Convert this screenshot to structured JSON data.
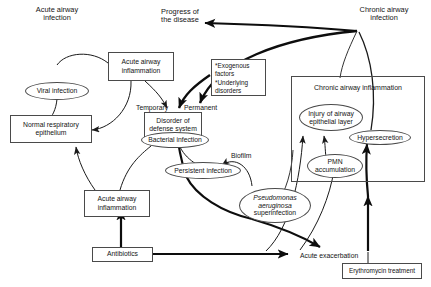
{
  "figure": {
    "type": "flow-diagram",
    "region_captions": [
      {
        "id": "acute-region",
        "text": "Acute airway\ninfection"
      },
      {
        "id": "chronic-region",
        "text": "Chronic airway\ninfection"
      },
      {
        "id": "progress-outcome",
        "text": "Progress of\nthe disease"
      }
    ],
    "nodes": {
      "normal_respiratory_epithelium": {
        "shape": "rect",
        "text": "Normal respiratory\nepithelium"
      },
      "viral_infection": {
        "shape": "ellipse",
        "text": "Viral infection"
      },
      "acute_airway_inflammation_top": {
        "shape": "rect",
        "text": "Acute airway\ninflammation"
      },
      "acute_airway_inflammation_bottom": {
        "shape": "rect",
        "text": "Acute airway\ninflammation"
      },
      "disorder_of_defense_system": {
        "shape": "rect",
        "text": "Disorder of\ndefense system"
      },
      "bacterial_infection": {
        "shape": "ellipse",
        "text": "Bacterial infection"
      },
      "persistent_infection": {
        "shape": "ellipse",
        "text": "Persistent infection"
      },
      "pseudomonas_superinfection": {
        "shape": "ellipse",
        "text_italic": "Pseudomonas\naeruginosa",
        "text_plain": "superinfection"
      },
      "chronic_airway_inflammation": {
        "shape": "group-title",
        "text": "Chronic airway inflammation"
      },
      "injury_of_airway_epithelial_layer": {
        "shape": "ellipse",
        "text": "Injury of airway\nepithelial layer"
      },
      "hypersecretion": {
        "shape": "ellipse",
        "text": "Hypersecretion"
      },
      "pmn_accumulation": {
        "shape": "ellipse",
        "text": "PMN\naccumulation"
      },
      "antibiotics": {
        "shape": "rect",
        "text": "Antibiotics"
      },
      "erythromycin_treatment": {
        "shape": "rect",
        "text": "Erythromycin treatment"
      },
      "factors_list": {
        "shape": "rect-list",
        "text": "*Exogenous\n  factors\n*Underlying\n  disorders"
      }
    },
    "edge_labels": [
      {
        "id": "temporary",
        "text": "Temporary"
      },
      {
        "id": "permanent",
        "text": "Permanent"
      },
      {
        "id": "biofilm",
        "text": "Biofilm"
      },
      {
        "id": "acute-exacerbation",
        "text": "Acute exacerbation"
      }
    ],
    "colors": {
      "stroke": "#4a4a4a",
      "line": "#1a1a1a",
      "text": "#141414",
      "background": "#ffffff"
    }
  }
}
